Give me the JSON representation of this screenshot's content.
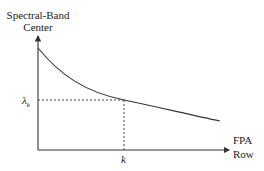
{
  "diagram": {
    "y_axis_label": [
      "Spectral-Band",
      "Center"
    ],
    "x_axis_label": [
      "FPA",
      "Row"
    ],
    "lambda_label": "λ",
    "lambda_subscript": "k",
    "k_label": "k",
    "colors": {
      "line": "#333333",
      "dash": "#444444",
      "background": "#ffffff"
    },
    "curve": "decreasing convex curve from top-left to lower-right",
    "marker_point": {
      "x_label": "k",
      "y_label": "λk"
    }
  }
}
